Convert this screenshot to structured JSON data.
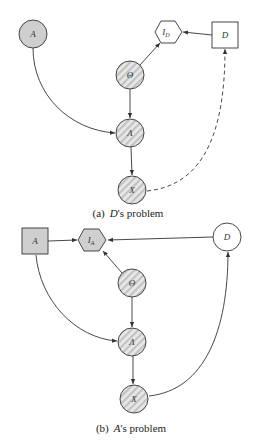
{
  "figure_a": {
    "caption_prefix": "(a)",
    "caption_agent": "D",
    "caption_suffix": "'s problem",
    "nodes": {
      "A": {
        "label": "A",
        "shape": "circle",
        "fill": "gray"
      },
      "I_D": {
        "label": "I",
        "sub": "D",
        "shape": "hexagon",
        "fill": "white"
      },
      "D": {
        "label": "D",
        "shape": "square",
        "fill": "white"
      },
      "Theta": {
        "label": "Θ",
        "shape": "circle",
        "fill": "hatched"
      },
      "Lambda": {
        "label": "Λ",
        "shape": "circle",
        "fill": "hatched"
      },
      "X": {
        "label": "X",
        "shape": "circle",
        "fill": "hatched"
      }
    },
    "edges": [
      {
        "from": "D",
        "to": "I_D",
        "style": "solid"
      },
      {
        "from": "Theta",
        "to": "I_D",
        "style": "solid"
      },
      {
        "from": "Theta",
        "to": "Lambda",
        "style": "solid"
      },
      {
        "from": "A",
        "to": "Lambda",
        "style": "solid"
      },
      {
        "from": "Lambda",
        "to": "X",
        "style": "solid"
      },
      {
        "from": "X",
        "to": "D",
        "style": "dashed"
      }
    ]
  },
  "figure_b": {
    "caption_prefix": "(b)",
    "caption_agent": "A",
    "caption_suffix": "'s problem",
    "nodes": {
      "A": {
        "label": "A",
        "shape": "square",
        "fill": "gray"
      },
      "I_A": {
        "label": "I",
        "sub": "A",
        "shape": "hexagon",
        "fill": "gray"
      },
      "D": {
        "label": "D",
        "shape": "circle",
        "fill": "white"
      },
      "Theta": {
        "label": "Θ",
        "shape": "circle",
        "fill": "hatched"
      },
      "Lambda": {
        "label": "Λ",
        "shape": "circle",
        "fill": "hatched"
      },
      "X": {
        "label": "X",
        "shape": "circle",
        "fill": "hatched"
      }
    },
    "edges": [
      {
        "from": "A",
        "to": "I_A",
        "style": "solid"
      },
      {
        "from": "D",
        "to": "I_A",
        "style": "solid"
      },
      {
        "from": "Theta",
        "to": "I_A",
        "style": "solid"
      },
      {
        "from": "Theta",
        "to": "Lambda",
        "style": "solid"
      },
      {
        "from": "A",
        "to": "Lambda",
        "style": "solid"
      },
      {
        "from": "Lambda",
        "to": "X",
        "style": "solid"
      },
      {
        "from": "X",
        "to": "D",
        "style": "solid"
      }
    ]
  },
  "colors": {
    "gray_fill": "#cfcfcf",
    "hatch_light": "#e6e6e6",
    "hatch_dark": "#c4c4c4",
    "stroke": "#333333"
  }
}
